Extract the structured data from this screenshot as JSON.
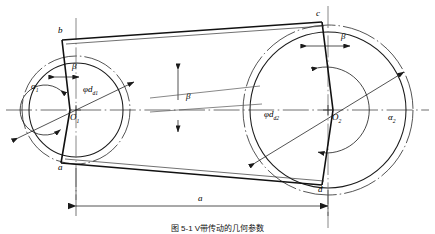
{
  "figure": {
    "kind": "belt-drive-schematic",
    "caption": "图 5-1  V带传动的几何参数",
    "colors": {
      "stroke": "#1a1a1a",
      "thin": "#5a5a5a",
      "background": "#ffffff"
    }
  },
  "labels": {
    "point_b": "b",
    "point_a": "a",
    "point_c": "c",
    "point_d": "d",
    "center_left": "O",
    "center_left_sub": "1",
    "center_right": "O",
    "center_right_sub": "2",
    "wrap_angle_left": "α",
    "wrap_angle_left_sub": "1",
    "wrap_angle_right": "α",
    "wrap_angle_right_sub": "2",
    "beta_left": "β",
    "beta_center": "β",
    "beta_right": "β",
    "diameter_left": "φd",
    "diameter_left_sub": "d1",
    "diameter_right": "φd",
    "diameter_right_sub": "d2",
    "center_distance": "a"
  },
  "geometry": {
    "left_pulley": {
      "cx": 76,
      "cy": 110,
      "r_outer_dashdot": 54,
      "r_solid": 47,
      "r_inner_arc": 25
    },
    "right_pulley": {
      "cx": 328,
      "cy": 110,
      "r_outer_dashdot": 85,
      "r_solid": 78,
      "r_inner_arc": 43
    },
    "tangent_points": {
      "b": [
        62,
        40
      ],
      "a": [
        61,
        163
      ],
      "c": [
        322,
        22
      ],
      "d": [
        322,
        185
      ]
    },
    "dimension_line": {
      "y": 206,
      "x_start": 76,
      "x_end": 328
    }
  }
}
